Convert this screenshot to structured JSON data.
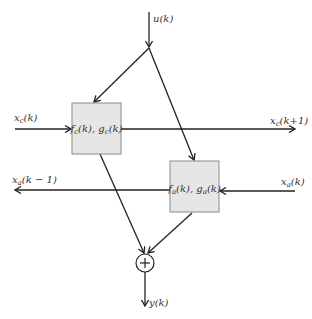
{
  "diagram": {
    "type": "block-diagram",
    "nodes": {
      "input_u": {
        "label": "u(k)",
        "base": "u",
        "arg": "(k)"
      },
      "block_c": {
        "label": "f_c(k), g_c(k)",
        "f": "f",
        "f_sub": "c",
        "g": "g",
        "g_sub": "c",
        "arg": "(k)"
      },
      "block_a": {
        "label": "f_a(k), g_a(k)",
        "f": "f",
        "f_sub": "a",
        "g": "g",
        "g_sub": "a",
        "arg": "(k)"
      },
      "sum": {
        "label": "+",
        "symbol": "+"
      },
      "output_y": {
        "label": "y(k)",
        "base": "y",
        "arg": "(k)"
      }
    },
    "signals": {
      "xc_in": {
        "label": "x_c(k)",
        "base": "x",
        "sub": "c",
        "arg": "(k)"
      },
      "xc_out": {
        "label": "x_c(k+1)",
        "base": "x",
        "sub": "c",
        "arg": "(k+1)"
      },
      "xa_in": {
        "label": "x_a(k)",
        "base": "x",
        "sub": "a",
        "arg": "(k)"
      },
      "xa_out": {
        "label": "x_a(k − 1)",
        "base": "x",
        "sub": "a",
        "arg": "(k − 1)"
      }
    },
    "edges": [
      {
        "from": "input_u",
        "to": "junction"
      },
      {
        "from": "junction",
        "to": "block_c"
      },
      {
        "from": "junction",
        "to": "block_a"
      },
      {
        "from": "xc_in",
        "to": "block_c"
      },
      {
        "from": "block_c",
        "to": "xc_out"
      },
      {
        "from": "xa_in",
        "to": "block_a"
      },
      {
        "from": "block_a",
        "to": "xa_out"
      },
      {
        "from": "block_c",
        "to": "sum"
      },
      {
        "from": "block_a",
        "to": "sum"
      },
      {
        "from": "sum",
        "to": "output_y"
      }
    ]
  }
}
